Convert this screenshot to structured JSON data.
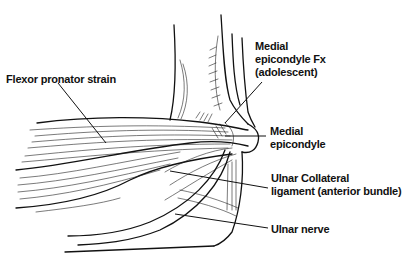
{
  "figure": {
    "labels": {
      "flexor_pronator": {
        "lines": [
          "Flexor pronator strain"
        ]
      },
      "medial_epicondyle_fx": {
        "lines": [
          "Medial",
          "epicondyle Fx",
          "(adolescent)"
        ]
      },
      "medial_epicondyle": {
        "lines": [
          "Medial",
          "epicondyle"
        ]
      },
      "ulnar_collateral": {
        "lines": [
          "Ulnar Collateral",
          "ligament (anterior bundle)"
        ]
      },
      "ulnar_nerve": {
        "lines": [
          "Ulnar nerve"
        ]
      }
    },
    "colors": {
      "ink": "#111111",
      "background": "#ffffff"
    }
  }
}
